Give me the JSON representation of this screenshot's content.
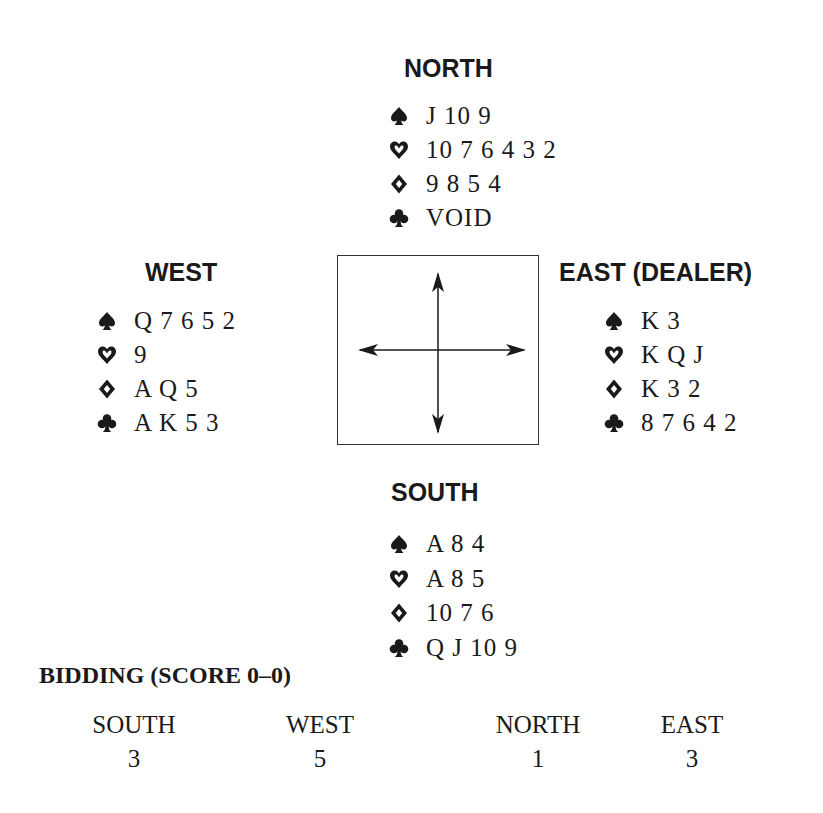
{
  "hands": {
    "north": {
      "heading": "NORTH",
      "spades": "J 10 9",
      "hearts": "10 7 6 4 3 2",
      "diamonds": "9 8 5 4",
      "clubs": "VOID"
    },
    "west": {
      "heading": "WEST",
      "spades": "Q 7 6 5 2",
      "hearts": "9",
      "diamonds": "A Q 5",
      "clubs": "A K 5 3"
    },
    "east": {
      "heading": "EAST (DEALER)",
      "spades": "K 3",
      "hearts": "K Q J",
      "diamonds": "K 3 2",
      "clubs": "8 7 6 4 2"
    },
    "south": {
      "heading": "SOUTH",
      "spades": "A 8 4",
      "hearts": "A 8 5",
      "diamonds": "10 7 6",
      "clubs": "Q J 10 9"
    }
  },
  "suit_icons": [
    "spade-icon",
    "heart-icon",
    "diamond-icon",
    "club-icon"
  ],
  "compass": {
    "icon": "four-way-arrow-icon"
  },
  "bidding": {
    "title": "BIDDING (SCORE 0–0)",
    "columns": [
      {
        "player": "SOUTH",
        "bid": "3"
      },
      {
        "player": "WEST",
        "bid": "5"
      },
      {
        "player": "NORTH",
        "bid": "1"
      },
      {
        "player": "EAST",
        "bid": "3"
      }
    ]
  }
}
